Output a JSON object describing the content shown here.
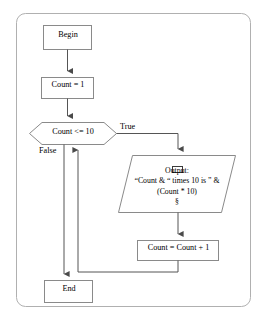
{
  "diagram": {
    "colors": {
      "frame_border": "#b0b0b0",
      "node_border": "#8a8a8a",
      "connector": "#555555",
      "text": "#000000",
      "background": "#ffffff"
    },
    "nodes": [
      {
        "id": "begin",
        "shape": "rectangle",
        "label": "Begin"
      },
      {
        "id": "init",
        "shape": "rectangle",
        "label": "Count = 1"
      },
      {
        "id": "condition",
        "shape": "decision",
        "label": "Count <= 10"
      },
      {
        "id": "output",
        "shape": "parallelogram",
        "lines": [
          "Output:",
          "“Count & “ times 10 is ” &",
          "(Count * 10)",
          "§"
        ],
        "glyph": "missing-character-box"
      },
      {
        "id": "increment",
        "shape": "rectangle",
        "label": "Count = Count + 1"
      },
      {
        "id": "end",
        "shape": "rectangle",
        "label": "End"
      }
    ],
    "edge_labels": {
      "true_branch": "True",
      "false_branch": "False"
    }
  }
}
